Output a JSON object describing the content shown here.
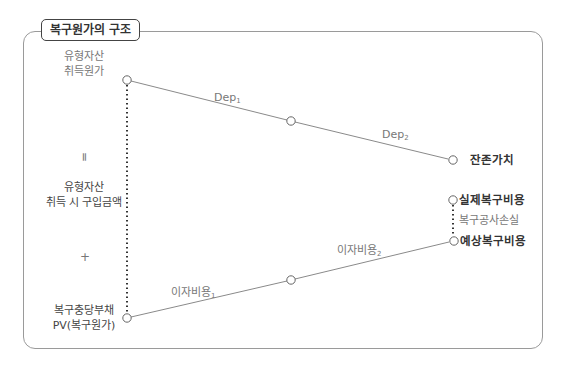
{
  "title": "복구원가의 구조",
  "left_labels": {
    "asset_cost": [
      "유형자산",
      "취득원가"
    ],
    "equals": "=",
    "purchase_amount": [
      "유형자산",
      "취득 시 구입금액"
    ],
    "plus": "+",
    "provision": [
      "복구충당부채",
      "PV(복구원가)"
    ]
  },
  "edges": {
    "dep1": {
      "base": "Dep",
      "sub": "1"
    },
    "dep2": {
      "base": "Dep",
      "sub": "2"
    },
    "interest1": {
      "base": "이자비용",
      "sub": "1"
    },
    "interest2": {
      "base": "이자비용",
      "sub": "2"
    }
  },
  "right_labels": {
    "residual_value": "잔존가치",
    "actual_cost": "실제복구비용",
    "restoration_loss": "복구공사손실",
    "expected_cost": "예상복구비용"
  },
  "colors": {
    "line": "#8a8a8a",
    "dotted": "#333333",
    "frame": "#9a9a9a",
    "text": "#555555"
  }
}
